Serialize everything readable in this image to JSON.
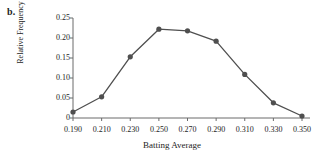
{
  "panel": {
    "label": "b."
  },
  "chart_data": {
    "type": "line",
    "title": "",
    "subtitle": "",
    "xlabel": "Batting Average",
    "ylabel": "Relative Frequency",
    "x": [
      0.19,
      0.21,
      0.23,
      0.25,
      0.27,
      0.29,
      0.31,
      0.33,
      0.35
    ],
    "values": [
      0.015,
      0.053,
      0.153,
      0.222,
      0.218,
      0.192,
      0.109,
      0.038,
      0.005
    ],
    "xtick_labels": [
      "0.190",
      "0.210",
      "0.230",
      "0.250",
      "0.270",
      "0.290",
      "0.310",
      "0.330",
      "0.350"
    ],
    "ytick_labels": [
      "0",
      "0.05",
      "0.10",
      "0.15",
      "0.20",
      "0.25"
    ],
    "ytick_values": [
      0,
      0.05,
      0.1,
      0.15,
      0.2,
      0.25
    ],
    "xlim": [
      0.18,
      0.358
    ],
    "ylim": [
      0,
      0.25
    ],
    "grid": false,
    "legend": "none",
    "marker": "circle",
    "line_color": "#4f4f4f",
    "marker_color": "#4f4f4f",
    "axis_color": "#6b6b6b",
    "background": "#ffffff"
  }
}
